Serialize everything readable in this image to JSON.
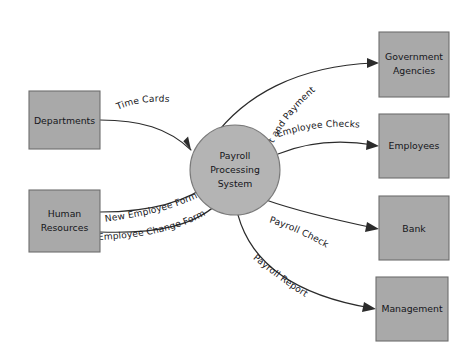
{
  "diagram": {
    "type": "data-flow-diagram",
    "background_color": "#ffffff",
    "entity_fill_color": "#a9a9a9",
    "entity_stroke_color": "#6e6e6e",
    "process_fill_color": "#b4b4b4",
    "flow_line_color": "#2b2b2b",
    "process": {
      "name": "payroll-processing-system",
      "label_line1": "Payroll",
      "label_line2": "Processing",
      "label_line3": "System",
      "shape": "circle",
      "cx": 235,
      "cy": 170,
      "r": 45
    },
    "entities": [
      {
        "name": "departments",
        "label_line1": "Departments",
        "label_line2": "",
        "x": 29,
        "y": 91,
        "width": 71,
        "height": 58,
        "side": "left"
      },
      {
        "name": "human-resources",
        "label_line1": "Human",
        "label_line2": "Resources",
        "x": 29,
        "y": 190,
        "width": 71,
        "height": 62,
        "side": "left"
      },
      {
        "name": "government-agencies",
        "label_line1": "Government",
        "label_line2": "Agencies",
        "x": 379,
        "y": 32,
        "width": 70,
        "height": 65,
        "side": "right"
      },
      {
        "name": "employees",
        "label_line1": "Employees",
        "label_line2": "",
        "x": 379,
        "y": 114,
        "width": 70,
        "height": 64,
        "side": "right"
      },
      {
        "name": "bank",
        "label_line1": "Bank",
        "label_line2": "",
        "x": 379,
        "y": 196,
        "width": 70,
        "height": 64,
        "side": "right"
      },
      {
        "name": "management",
        "label_line1": "Management",
        "label_line2": "",
        "x": 376,
        "y": 277,
        "width": 72,
        "height": 64,
        "side": "right"
      }
    ],
    "flows": [
      {
        "name": "time-cards",
        "label": "Time Cards",
        "from": "departments",
        "to": "payroll-processing-system",
        "direction": "inbound"
      },
      {
        "name": "new-employee-form",
        "label": "New Employee Form",
        "from": "human-resources",
        "to": "payroll-processing-system",
        "direction": "inbound"
      },
      {
        "name": "employee-change-form",
        "label": "Employee Change Form",
        "from": "human-resources",
        "to": "payroll-processing-system",
        "direction": "inbound"
      },
      {
        "name": "tax-report-and-payment",
        "label": "Tax Report and Payment",
        "from": "payroll-processing-system",
        "to": "government-agencies",
        "direction": "outbound"
      },
      {
        "name": "employee-checks",
        "label": "Employee Checks",
        "from": "payroll-processing-system",
        "to": "employees",
        "direction": "outbound"
      },
      {
        "name": "payroll-check",
        "label": "Payroll Check",
        "from": "payroll-processing-system",
        "to": "bank",
        "direction": "outbound"
      },
      {
        "name": "payroll-report",
        "label": "Payroll Report",
        "from": "payroll-processing-system",
        "to": "management",
        "direction": "outbound"
      }
    ]
  }
}
